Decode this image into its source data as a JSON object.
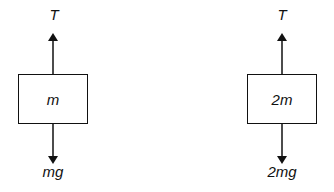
{
  "diagram": {
    "type": "free-body diagrams",
    "bodies": [
      {
        "mass_label": "m",
        "up_force": "T",
        "down_force": "mg"
      },
      {
        "mass_label": "2m",
        "up_force": "T",
        "down_force": "2mg"
      }
    ]
  }
}
